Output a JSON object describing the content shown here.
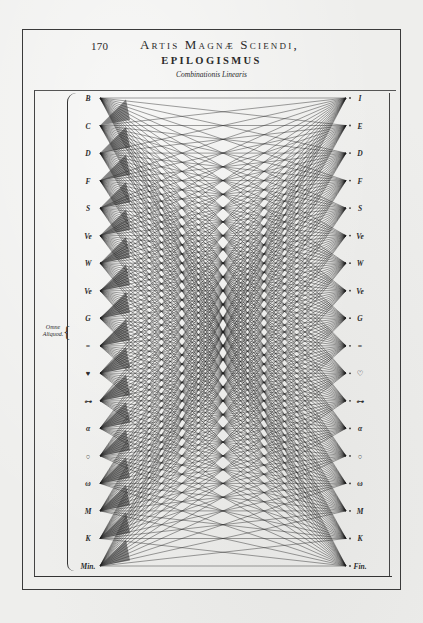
{
  "page": {
    "number": "170",
    "running_head": "Artis Magnæ Sciendi,",
    "section_title": "EPILOGISMUS",
    "subtitle": "Combinationis Linearis"
  },
  "bracket_label": "Omne Aliquod.",
  "left_labels": [
    "B",
    "C",
    "D",
    "F",
    "S",
    "Ve",
    "W",
    "Ve",
    "G",
    "=",
    "♥",
    "⊶",
    "α",
    "○",
    "ω",
    "M",
    "K",
    "Min."
  ],
  "right_labels": [
    "I",
    "E",
    "D",
    "F",
    "S",
    "Ve",
    "W",
    "Ve",
    "G",
    "=",
    "♡",
    "⊶",
    "α",
    "○",
    "ω",
    "M",
    "K",
    "Fin."
  ],
  "colors": {
    "paper": "#eeeeec",
    "ink": "#2a2a2a"
  }
}
